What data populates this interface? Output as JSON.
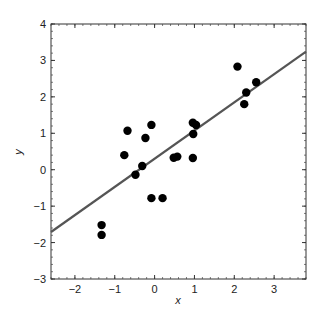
{
  "chart_data": {
    "type": "scatter",
    "title": "",
    "xlabel": "x",
    "ylabel": "y",
    "xlim": [
      -2.6,
      3.8
    ],
    "ylim": [
      -3,
      4
    ],
    "xticks": [
      -2,
      -1,
      0,
      1,
      2,
      3
    ],
    "yticks": [
      -3,
      -2,
      -1,
      0,
      1,
      2,
      3,
      4
    ],
    "xtick_labels": [
      "−2",
      "−1",
      "0",
      "1",
      "2",
      "3"
    ],
    "ytick_labels": [
      "−3",
      "−2",
      "−1",
      "0",
      "1",
      "2",
      "3",
      "4"
    ],
    "grid": false,
    "legend": null,
    "series": [
      {
        "name": "data",
        "type": "scatter",
        "color": "#000000",
        "points": [
          {
            "x": -1.33,
            "y": -1.52
          },
          {
            "x": -1.33,
            "y": -1.79
          },
          {
            "x": -0.76,
            "y": 0.4
          },
          {
            "x": -0.68,
            "y": 1.07
          },
          {
            "x": -0.48,
            "y": -0.14
          },
          {
            "x": -0.31,
            "y": 0.1
          },
          {
            "x": -0.23,
            "y": 0.87
          },
          {
            "x": -0.08,
            "y": 1.23
          },
          {
            "x": -0.08,
            "y": -0.78
          },
          {
            "x": 0.2,
            "y": -0.78
          },
          {
            "x": 0.48,
            "y": 0.33
          },
          {
            "x": 0.57,
            "y": 0.36
          },
          {
            "x": 0.96,
            "y": 0.32
          },
          {
            "x": 0.97,
            "y": 0.98
          },
          {
            "x": 0.96,
            "y": 1.29
          },
          {
            "x": 1.04,
            "y": 1.23
          },
          {
            "x": 2.08,
            "y": 2.83
          },
          {
            "x": 2.25,
            "y": 1.8
          },
          {
            "x": 2.3,
            "y": 2.12
          },
          {
            "x": 2.55,
            "y": 2.4
          }
        ]
      },
      {
        "name": "regression line",
        "type": "line",
        "color": "#555555",
        "slope": 0.773,
        "intercept": 0.3,
        "x": [
          -2.6,
          3.8
        ],
        "y": [
          -1.71,
          3.24
        ]
      }
    ]
  }
}
